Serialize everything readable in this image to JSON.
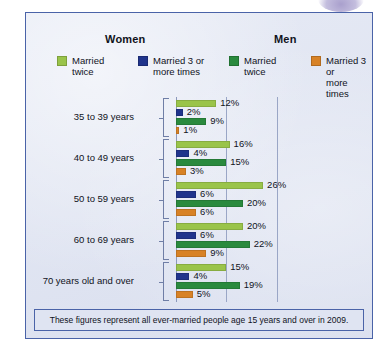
{
  "panel": {
    "group_titles": {
      "women": "Women",
      "men": "Men"
    },
    "footnote": "These figures represent all ever-married people age 15 years and over in 2009."
  },
  "legend": [
    {
      "id": "women-married-twice",
      "label": "Married\ntwice",
      "color": "#9ac44a"
    },
    {
      "id": "women-married-3plus",
      "label": "Married 3 or\nmore times",
      "color": "#20348c"
    },
    {
      "id": "men-married-twice",
      "label": "Married\ntwice",
      "color": "#2a8a3e"
    },
    {
      "id": "men-married-3plus",
      "label": "Married 3 or\nmore times",
      "color": "#d88226"
    }
  ],
  "chart_data": {
    "type": "bar",
    "orientation": "horizontal",
    "title": "",
    "xlabel": "",
    "ylabel": "",
    "xlim": [
      0,
      30
    ],
    "grid": true,
    "gridlines": [
      0,
      15,
      30
    ],
    "legend_position": "top",
    "categories": [
      "35 to 39 years",
      "40 to 49 years",
      "50 to 59 years",
      "60 to 69 years",
      "70 years old and over"
    ],
    "series": [
      {
        "name": "Women: Married twice",
        "color": "#9ac44a",
        "values": [
          12,
          16,
          26,
          20,
          15
        ],
        "labels": [
          "12%",
          "16%",
          "26%",
          "20%",
          "15%"
        ]
      },
      {
        "name": "Women: Married 3 or more times",
        "color": "#20348c",
        "values": [
          2,
          4,
          6,
          6,
          4
        ],
        "labels": [
          "2%",
          "4%",
          "6%",
          "6%",
          "4%"
        ]
      },
      {
        "name": "Men: Married twice",
        "color": "#2a8a3e",
        "values": [
          9,
          15,
          20,
          22,
          19
        ],
        "labels": [
          "9%",
          "15%",
          "20%",
          "22%",
          "19%"
        ]
      },
      {
        "name": "Men: Married 3 or more times",
        "color": "#d88226",
        "values": [
          1,
          3,
          6,
          9,
          5
        ],
        "labels": [
          "1%",
          "3%",
          "6%",
          "9%",
          "5%"
        ]
      }
    ]
  }
}
